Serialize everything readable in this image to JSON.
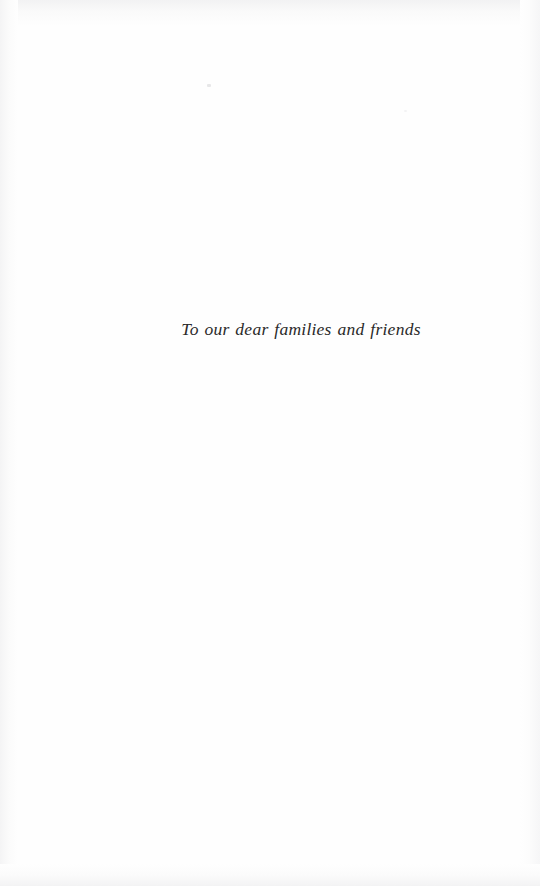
{
  "page": {
    "kind": "book-dedication-page",
    "width": 540,
    "height": 886,
    "background_color": "#fefefe",
    "text_color": "#2a2a2a"
  },
  "dedication": {
    "text": "To our dear families and friends"
  },
  "artifacts": {
    "speck_a": "",
    "speck_b": ""
  }
}
